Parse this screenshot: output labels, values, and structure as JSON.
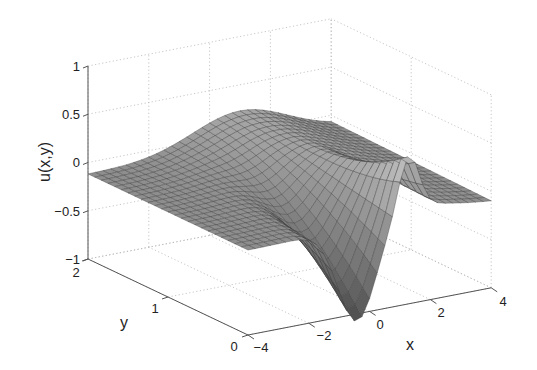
{
  "chart_data": {
    "type": "surface",
    "title": "",
    "xlabel": "x",
    "ylabel": "y",
    "zlabel": "u(x,y)",
    "xlim": [
      -4,
      4
    ],
    "ylim": [
      0,
      2
    ],
    "zlim": [
      -1,
      1
    ],
    "xticks": [
      -4,
      -2,
      0,
      2,
      4
    ],
    "yticks": [
      0,
      1,
      2
    ],
    "zticks": [
      -1,
      -0.5,
      0,
      0.5,
      1
    ],
    "xtick_labels": [
      "−4",
      "−2",
      "0",
      "2",
      "4"
    ],
    "ytick_labels": [
      "0",
      "1",
      "2"
    ],
    "ztick_labels": [
      "−1",
      "−0.5",
      "0",
      "0.5",
      "1"
    ],
    "grid": true,
    "colormap": "gray",
    "surface_description": "Mesh surface u(x,y) over x in [-4,4], y in [0,2]; nearly flat near u≈-0.1 at x=±4, a sharp trough reaching about -0.95 near x≈-0.5 at y=0, a narrow crest reaching about 0.3 near x≈1 at y=0, and a broad ridge of about 0.25 along y=2 near x≈0..2.",
    "sample_points": [
      {
        "x": -4,
        "y": 0,
        "u": -0.12
      },
      {
        "x": -4,
        "y": 2,
        "u": -0.08
      },
      {
        "x": -0.5,
        "y": 0,
        "u": -0.95
      },
      {
        "x": 1,
        "y": 0,
        "u": 0.3
      },
      {
        "x": 1,
        "y": 2,
        "u": 0.25
      },
      {
        "x": 4,
        "y": 0,
        "u": -0.15
      },
      {
        "x": 4,
        "y": 2,
        "u": -0.05
      }
    ]
  },
  "labels": {
    "x": "x",
    "y": "y",
    "z": "u(x,y)"
  },
  "ticks": {
    "z": [
      "1",
      "0.5",
      "0",
      "−0.5",
      "−1"
    ],
    "y": [
      "2",
      "1",
      "0"
    ],
    "x": [
      "−4",
      "−2",
      "0",
      "2",
      "4"
    ]
  }
}
